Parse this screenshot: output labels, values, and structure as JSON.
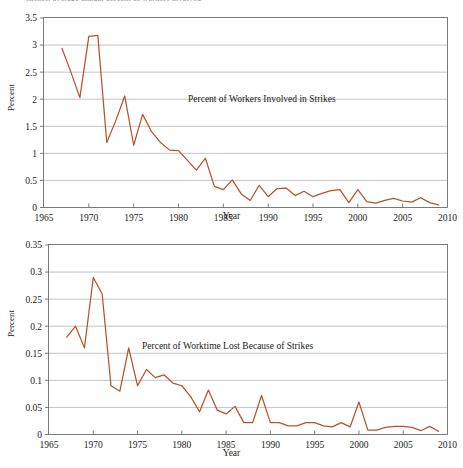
{
  "page": {
    "clipped_header_text": "strikes, average annual percent of workers involved",
    "line_color": "#b8522c",
    "grid_color": "#a9a9a9",
    "axis_color": "#6d6d6d"
  },
  "charts": [
    {
      "id": "workers-involved-in-strikes",
      "annotation": "Percent of Workers Involved in Strikes",
      "ylabel": "Percent",
      "xlabel": "Year",
      "chart_data": {
        "type": "line",
        "title": "Percent of Workers Involved in Strikes",
        "xlabel": "Year",
        "ylabel": "Percent",
        "xlim": [
          1965,
          2010
        ],
        "ylim": [
          0,
          3.5
        ],
        "xticks": [
          1965,
          1970,
          1975,
          1980,
          1985,
          1990,
          1995,
          2000,
          2005,
          2010
        ],
        "yticks": [
          0,
          0.5,
          1,
          1.5,
          2,
          2.5,
          3,
          3.5
        ],
        "grid": "horizontal",
        "legend": "none",
        "series": [
          {
            "name": "Percent of Workers Involved in Strikes",
            "x": [
              1967,
              1968,
              1969,
              1970,
              1971,
              1972,
              1973,
              1974,
              1975,
              1976,
              1977,
              1978,
              1979,
              1980,
              1981,
              1982,
              1983,
              1984,
              1985,
              1986,
              1987,
              1988,
              1989,
              1990,
              1991,
              1992,
              1993,
              1994,
              1995,
              1996,
              1997,
              1998,
              1999,
              2000,
              2001,
              2002,
              2003,
              2004,
              2005,
              2006,
              2007,
              2008,
              2009
            ],
            "values": [
              2.94,
              2.5,
              2.03,
              3.16,
              3.18,
              1.2,
              1.6,
              2.06,
              1.15,
              1.72,
              1.4,
              1.2,
              1.06,
              1.05,
              0.87,
              0.69,
              0.91,
              0.39,
              0.33,
              0.51,
              0.25,
              0.13,
              0.41,
              0.2,
              0.35,
              0.36,
              0.22,
              0.3,
              0.2,
              0.26,
              0.31,
              0.33,
              0.09,
              0.33,
              0.11,
              0.08,
              0.13,
              0.17,
              0.12,
              0.1,
              0.18,
              0.09,
              0.05
            ]
          }
        ]
      }
    },
    {
      "id": "worktime-lost-because-of-strikes",
      "annotation": "Percent of Worktime Lost Because of Strikes",
      "ylabel": "Percent",
      "xlabel": "Year",
      "chart_data": {
        "type": "line",
        "title": "Percent of Worktime Lost Because of Strikes",
        "xlabel": "Year",
        "ylabel": "Percent",
        "xlim": [
          1965,
          2010
        ],
        "ylim": [
          0,
          0.35
        ],
        "xticks": [
          1965,
          1970,
          1975,
          1980,
          1985,
          1990,
          1995,
          2000,
          2005,
          2010
        ],
        "yticks": [
          0,
          0.05,
          0.1,
          0.15,
          0.2,
          0.25,
          0.3,
          0.35
        ],
        "grid": "horizontal",
        "legend": "none",
        "series": [
          {
            "name": "Percent of Worktime Lost Because of Strikes",
            "x": [
              1967,
              1968,
              1969,
              1970,
              1971,
              1972,
              1973,
              1974,
              1975,
              1976,
              1977,
              1978,
              1979,
              1980,
              1981,
              1982,
              1983,
              1984,
              1985,
              1986,
              1987,
              1988,
              1989,
              1990,
              1991,
              1992,
              1993,
              1994,
              1995,
              1996,
              1997,
              1998,
              1999,
              2000,
              2001,
              2002,
              2003,
              2004,
              2005,
              2006,
              2007,
              2008,
              2009
            ],
            "values": [
              0.18,
              0.2,
              0.16,
              0.29,
              0.26,
              0.09,
              0.08,
              0.16,
              0.09,
              0.12,
              0.105,
              0.11,
              0.095,
              0.09,
              0.07,
              0.042,
              0.082,
              0.045,
              0.038,
              0.052,
              0.022,
              0.022,
              0.072,
              0.022,
              0.022,
              0.016,
              0.016,
              0.022,
              0.022,
              0.016,
              0.014,
              0.022,
              0.014,
              0.06,
              0.008,
              0.008,
              0.013,
              0.015,
              0.015,
              0.013,
              0.007,
              0.015,
              0.006
            ]
          }
        ]
      }
    }
  ]
}
